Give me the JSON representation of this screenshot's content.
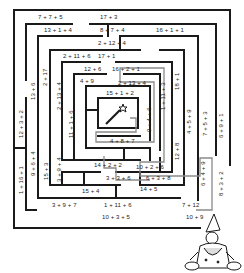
{
  "puzzle": {
    "type": "math-maze",
    "colors": {
      "wall": "#1a1a1a",
      "path": "#8a8a8a",
      "background": "#ffffff"
    },
    "center_icon": "magic-wand-icon",
    "character": "wizard-icon",
    "horizontal_labels": [
      "7 + 7 + 5",
      "17 + 3",
      "13 + 1 + 4",
      "8 + 7 + 4",
      "16 + 1 + 1",
      "2 + 12 + 4",
      "2 + 11 + 6",
      "17 + 1",
      "12 + 6",
      "16 + 2 + 1",
      "4 + 9",
      "2 + 13 + 4",
      "15 + 1 + 2",
      "4 + 8 + 7",
      "14 + 2 + 2",
      "10 + 2 + 6",
      "3 + 3 + 6",
      "6 + 3 + 8",
      "14 + 5",
      "15 + 4",
      "3 + 9 + 7",
      "1 + 11 + 6",
      "7 + 12",
      "10 + 3 + 5",
      "10 + 9"
    ],
    "vertical_labels": [
      "2 + 17",
      "13 + 6",
      "2 + 13 + 4",
      "12 + 3 + 2",
      "11 + 1 + 6",
      "9 + 6 + 4",
      "15 + 3",
      "3 + 9 + 4",
      "1 + 16 + 1",
      "1 + 11 + 3",
      "18 + 1",
      "9 + 4 + 6",
      "4 + 5 + 9",
      "7 + 5 + 3",
      "6 + 9 + 1",
      "12 + 8",
      "8 + 3 + 2",
      "6 + 4 + 9"
    ]
  }
}
